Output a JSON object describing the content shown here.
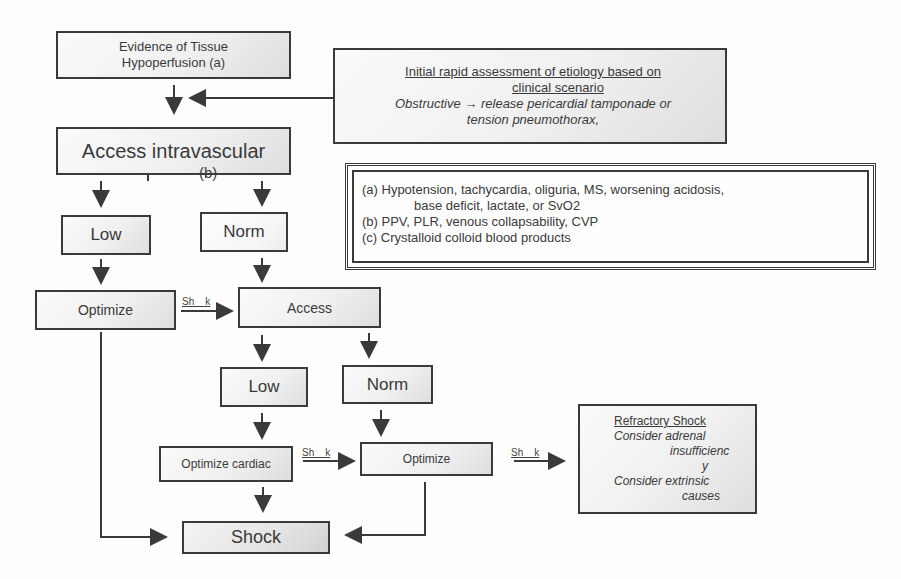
{
  "nodes": {
    "evidence": {
      "line1": "Evidence of Tissue",
      "line2": "Hypoperfusion (a)"
    },
    "access_intravascular": {
      "label": "Access intravascular",
      "sub": "(b)"
    },
    "low_1": {
      "label": "Low"
    },
    "norm_1": {
      "label": "Norm"
    },
    "optimize_1": {
      "label": "Optimize"
    },
    "access_2": {
      "label": "Access"
    },
    "low_2": {
      "label": "Low"
    },
    "norm_2": {
      "label": "Norm"
    },
    "optimize_cardiac": {
      "label": "Optimize cardiac"
    },
    "optimize_2": {
      "label": "Optimize"
    },
    "shock": {
      "label": "Shock"
    },
    "refractory": {
      "title": "Refractory Shock",
      "line1": "Consider adrenal",
      "line2": "insufficienc",
      "line3": "y",
      "line4": "Consider extrinsic",
      "line5": "causes"
    }
  },
  "assessment": {
    "title_line1": "Initial rapid assessment of etiology based on",
    "title_line2": "clinical scenario",
    "body_line1": "Obstructive →  release pericardial tamponade or",
    "body_line2": "tension pneumothorax,"
  },
  "legend": {
    "a_line1": "(a) Hypotension, tachycardia, oliguria,   MS, worsening acidosis,",
    "a_line2": "base deficit, lactate, or SvO2",
    "b": "(b) PPV, PLR, venous collapsability, CVP",
    "c": "(c) Crystalloid  colloid  blood products"
  },
  "edge_labels": {
    "shock_1": "Sh    k",
    "shock_2": "Sh    k",
    "shock_3": "Sh    k"
  },
  "colors": {
    "stroke": "#3a3a3a",
    "text": "#3a3a3a",
    "background": "#fdfdfd"
  }
}
